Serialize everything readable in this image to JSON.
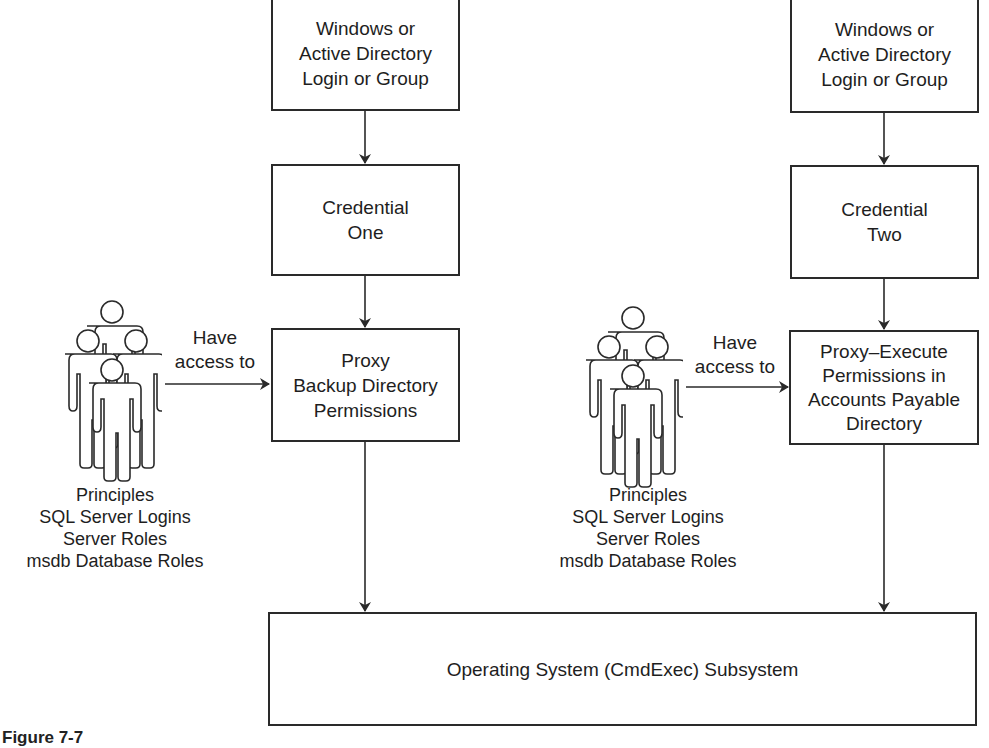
{
  "diagram": {
    "left_chain": {
      "login_box": "Windows or\nActive Directory\nLogin or Group",
      "credential_box": "Credential\nOne",
      "proxy_box": "Proxy\nBackup Directory\nPermissions",
      "access_label": "Have\naccess to",
      "principals_icon": "people-group-icon",
      "principals_label": "Principles\nSQL Server Logins\nServer Roles\nmsdb Database Roles"
    },
    "right_chain": {
      "login_box": "Windows or\nActive Directory\nLogin or Group",
      "credential_box": "Credential\nTwo",
      "proxy_box": "Proxy–Execute\nPermissions in\nAccounts Payable\nDirectory",
      "access_label": "Have\naccess to",
      "principals_icon": "people-group-icon",
      "principals_label": "Principles\nSQL Server Logins\nServer Roles\nmsdb Database Roles"
    },
    "subsystem_box": "Operating System (CmdExec) Subsystem",
    "caption": "Figure 7-7",
    "colors": {
      "line": "#2a2a2a",
      "background": "#ffffff",
      "text": "#1e1e1e"
    }
  }
}
